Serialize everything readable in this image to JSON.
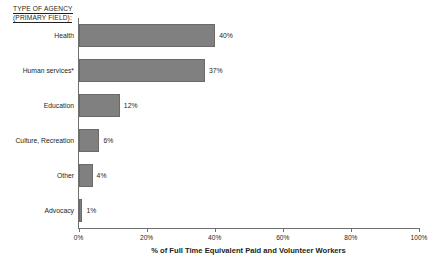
{
  "axis_heading": {
    "line1": "TYPE OF AGENCY",
    "line2": "(PRIMARY FIELD):"
  },
  "colors": {
    "bar_fill": "#808080",
    "bar_edge": "#6a6a6a",
    "axis": "#6f6f6f",
    "text": "#231f20",
    "background": "#ffffff"
  },
  "chart_data": {
    "type": "bar",
    "orientation": "horizontal",
    "title": "",
    "subtitle": "",
    "xlabel": "% of Full Time Equivalent Paid and Volunteer Workers",
    "ylabel": "TYPE OF AGENCY (PRIMARY FIELD):",
    "categories": [
      "Health",
      "Human services*",
      "Education",
      "Culture, Recreation",
      "Other",
      "Advocacy"
    ],
    "values": [
      40,
      37,
      12,
      6,
      4,
      1
    ],
    "data_labels": [
      "40%",
      "37%",
      "12%",
      "6%",
      "4%",
      "1%"
    ],
    "xlim": [
      0,
      100
    ],
    "xticks": [
      0,
      20,
      40,
      60,
      80,
      100
    ],
    "xtick_labels": [
      "0%",
      "20%",
      "40%",
      "60%",
      "80%",
      "100%"
    ],
    "grid": false,
    "legend": false,
    "legend_position": "none",
    "annotations": [
      "* asterisk on Human services category"
    ]
  }
}
